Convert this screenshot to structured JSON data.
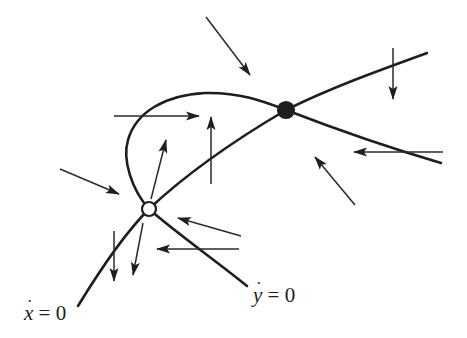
{
  "diagram": {
    "type": "phase-plane",
    "colors": {
      "stroke": "#1e1e1e",
      "background": "#ffffff"
    },
    "nullclines": [
      {
        "id": "x-dot-nullcline",
        "label_var": "x",
        "label_eq": "= 0",
        "label_text": "ẋ = 0",
        "path": "M78,306 C100,270 125,233 149,209 C185,175 235,140 286,110 C330,88 380,70 427,53"
      },
      {
        "id": "y-dot-nullcline",
        "label_var": "y",
        "label_eq": "= 0",
        "label_text": "ẏ = 0",
        "path": "M247,286 C215,260 175,232 149,209 C132,190 122,160 128,140 C136,112 165,95 205,93 C240,92 265,102 286,110 C330,127 390,148 441,163"
      }
    ],
    "equilibria": [
      {
        "id": "unstable-node",
        "kind": "open",
        "cx": 149,
        "cy": 209,
        "r": 7
      },
      {
        "id": "saddle-point",
        "kind": "filled",
        "cx": 286,
        "cy": 110,
        "r": 8
      }
    ],
    "arrows": [
      {
        "id": "arrow-top-center",
        "x1": 206,
        "y1": 17,
        "x2": 250,
        "y2": 75
      },
      {
        "id": "arrow-top-right-down",
        "x1": 393,
        "y1": 48,
        "x2": 393,
        "y2": 99
      },
      {
        "id": "arrow-upper-left-right",
        "x1": 114,
        "y1": 116,
        "x2": 199,
        "y2": 116
      },
      {
        "id": "arrow-center-up",
        "x1": 211,
        "y1": 184,
        "x2": 211,
        "y2": 117
      },
      {
        "id": "arrow-node-up",
        "x1": 151,
        "y1": 199,
        "x2": 166,
        "y2": 140
      },
      {
        "id": "arrow-left-diag",
        "x1": 60,
        "y1": 169,
        "x2": 119,
        "y2": 194
      },
      {
        "id": "arrow-right-left",
        "x1": 443,
        "y1": 152,
        "x2": 354,
        "y2": 152
      },
      {
        "id": "arrow-right-upleft",
        "x1": 355,
        "y1": 205,
        "x2": 315,
        "y2": 157
      },
      {
        "id": "arrow-below-node-upleft",
        "x1": 241,
        "y1": 236,
        "x2": 178,
        "y2": 218
      },
      {
        "id": "arrow-below-node-left",
        "x1": 239,
        "y1": 249,
        "x2": 157,
        "y2": 249
      },
      {
        "id": "arrow-lower-down-1",
        "x1": 114,
        "y1": 231,
        "x2": 114,
        "y2": 281
      },
      {
        "id": "arrow-lower-down-2",
        "x1": 143,
        "y1": 223,
        "x2": 133,
        "y2": 275
      }
    ],
    "labels": {
      "x_nullcline": {
        "var": "x",
        "dot": "˙",
        "eq": " = 0",
        "left": 24,
        "top": 303
      },
      "y_nullcline": {
        "var": "y",
        "dot": "˙",
        "eq": " = 0",
        "left": 253,
        "top": 285
      }
    }
  }
}
